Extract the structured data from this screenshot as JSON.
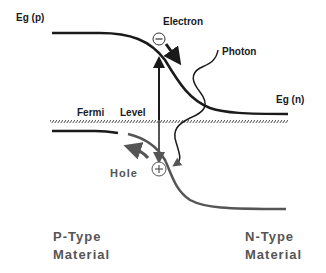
{
  "diagram": {
    "labels": {
      "eg_p": "Eg (p)",
      "eg_n": "Eg (n)",
      "electron": "Electron",
      "photon": "Photon",
      "fermi": "Fermi",
      "level": "Level",
      "hole": "Hole",
      "p_type_line1": "P-Type",
      "p_type_line2": "Material",
      "n_type_line1": "N-Type",
      "n_type_line2": "Material"
    },
    "symbols": {
      "electron": "−",
      "hole": "+"
    },
    "colors": {
      "conduction_band": "#1a1a1a",
      "valence_band": "#555555",
      "fermi_level": "#444444",
      "text_dark": "#1a1a1a",
      "text_grey": "#555555"
    }
  }
}
